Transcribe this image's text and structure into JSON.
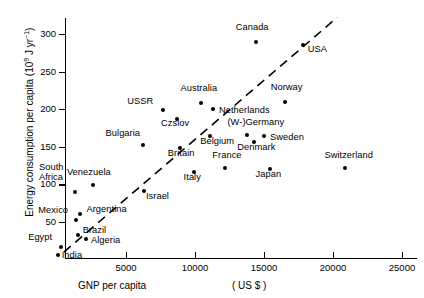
{
  "chart_data": {
    "type": "scatter",
    "title": "",
    "xlabel": "GNP per capita",
    "xunits": "( US $ )",
    "ylabel_text": "Energy consumption per capita (10",
    "ylabel_exp1": "9",
    "ylabel_mid": " J yr",
    "ylabel_exp2": "−1",
    "ylabel_end": ")",
    "ylabel_full": "Energy consumption per capita (10⁹ J yr⁻¹)",
    "xlim": [
      0,
      26500
    ],
    "ylim": [
      0,
      330
    ],
    "xticks": [
      5000,
      10000,
      15000,
      20000,
      25000
    ],
    "xtick_labels": [
      "5000",
      "10000",
      "15000",
      "20000",
      "25000"
    ],
    "yticks": [
      50,
      100,
      150,
      200,
      250,
      300
    ],
    "ytick_labels": [
      "50",
      "100",
      "150",
      "200",
      "250",
      "300"
    ],
    "grid": false,
    "legend": "none",
    "trendline": {
      "style": "dashed",
      "x0": 500,
      "y0": 10,
      "x1": 20300,
      "y1": 322
    },
    "points": [
      {
        "label": "Canada",
        "x": 14400,
        "y": 289,
        "lx": -20,
        "ly": -14
      },
      {
        "label": "USA",
        "x": 17800,
        "y": 286,
        "lx": 5,
        "ly": 5
      },
      {
        "label": "Norway",
        "x": 16500,
        "y": 210,
        "lx": -14,
        "ly": -14
      },
      {
        "label": "Australia",
        "x": 10400,
        "y": 208,
        "lx": -20,
        "ly": -14
      },
      {
        "label": "USSR",
        "x": 7700,
        "y": 199,
        "lx": -36,
        "ly": -8
      },
      {
        "label": "Netherlands",
        "x": 11300,
        "y": 200,
        "lx": 6,
        "ly": 2
      },
      {
        "label": "Czslov",
        "x": 8700,
        "y": 187,
        "lx": -16,
        "ly": 5
      },
      {
        "label": "(W-)Germany",
        "x": 13800,
        "y": 166,
        "lx": -20,
        "ly": -12
      },
      {
        "label": "Sweden",
        "x": 15000,
        "y": 165,
        "lx": 6,
        "ly": 2
      },
      {
        "label": "Belgium",
        "x": 11100,
        "y": 165,
        "lx": -10,
        "ly": 6
      },
      {
        "label": "Denmark",
        "x": 14300,
        "y": 157,
        "lx": -17,
        "ly": 6
      },
      {
        "label": "Bulgaria",
        "x": 6200,
        "y": 153,
        "lx": -37,
        "ly": -11
      },
      {
        "label": "Britain",
        "x": 8900,
        "y": 148,
        "lx": -12,
        "ly": 6
      },
      {
        "label": "France",
        "x": 12200,
        "y": 122,
        "lx": -13,
        "ly": -12
      },
      {
        "label": "Switzerland",
        "x": 20900,
        "y": 122,
        "lx": -21,
        "ly": -12
      },
      {
        "label": "Japan",
        "x": 15400,
        "y": 120,
        "lx": -14,
        "ly": 6
      },
      {
        "label": "Italy",
        "x": 9900,
        "y": 116,
        "lx": -10,
        "ly": 6
      },
      {
        "label": "Venezuela",
        "x": 2600,
        "y": 99,
        "lx": -26,
        "ly": -12
      },
      {
        "label": "Israel",
        "x": 6300,
        "y": 91,
        "lx": 2,
        "ly": 6
      },
      {
        "label": "South\nAfrica",
        "x": 1300,
        "y": 90,
        "lx": -36,
        "ly": -24
      },
      {
        "label": "Argentina",
        "x": 1700,
        "y": 60,
        "lx": 6,
        "ly": -4
      },
      {
        "label": "Mexico",
        "x": 1400,
        "y": 52,
        "lx": -38,
        "ly": -9
      },
      {
        "label": "Brazil",
        "x": 1500,
        "y": 33,
        "lx": 5,
        "ly": -4
      },
      {
        "label": "Algeria",
        "x": 2100,
        "y": 27,
        "lx": 5,
        "ly": 2
      },
      {
        "label": "Egypt",
        "x": 300,
        "y": 17,
        "lx": -33,
        "ly": -9
      },
      {
        "label": "India",
        "x": 50,
        "y": 6,
        "lx": 4,
        "ly": 1
      }
    ]
  }
}
